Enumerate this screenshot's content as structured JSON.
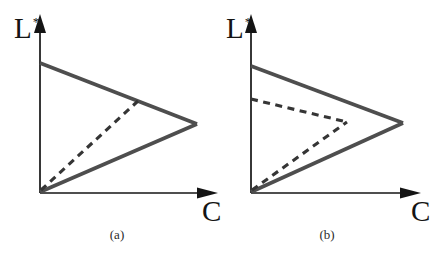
{
  "figure": {
    "background": "#ffffff",
    "colors": {
      "axis": "#141414",
      "solid": "#4e4e4e",
      "dashed": "#353535"
    },
    "panels": [
      {
        "id": "a",
        "caption": "(a)",
        "y_axis_label": "L",
        "y_axis_label_sup": "*",
        "x_axis_label": "C",
        "lines": [
          {
            "name": "y-axis",
            "type": "axis",
            "x1": 40,
            "y1": 193,
            "x2": 40,
            "y2": 26
          },
          {
            "name": "x-axis",
            "type": "axis",
            "x1": 40,
            "y1": 193,
            "x2": 205,
            "y2": 193
          },
          {
            "name": "solid-gamut-upper-edge",
            "type": "solid",
            "x1": 40,
            "y1": 63,
            "x2": 197,
            "y2": 124
          },
          {
            "name": "solid-gamut-lower-edge",
            "type": "solid",
            "x1": 40,
            "y1": 192,
            "x2": 197,
            "y2": 124
          },
          {
            "name": "dashed-gamut-lower-edge",
            "type": "dashed",
            "x1": 41,
            "y1": 190,
            "x2": 138,
            "y2": 101
          }
        ],
        "arrows": [
          {
            "name": "y-axis-arrowhead",
            "points": "40,14 34,33 46,33"
          },
          {
            "name": "x-axis-arrowhead",
            "points": "218,193 197,187.5 197,198.5"
          }
        ]
      },
      {
        "id": "b",
        "caption": "(b)",
        "y_axis_label": "L",
        "y_axis_label_sup": "*",
        "x_axis_label": "C",
        "lines": [
          {
            "name": "y-axis",
            "type": "axis",
            "x1": 251,
            "y1": 193,
            "x2": 251,
            "y2": 26
          },
          {
            "name": "x-axis",
            "type": "axis",
            "x1": 251,
            "y1": 193,
            "x2": 408,
            "y2": 193
          },
          {
            "name": "solid-gamut-upper-edge",
            "type": "solid",
            "x1": 251,
            "y1": 66,
            "x2": 403,
            "y2": 123
          },
          {
            "name": "solid-gamut-lower-edge",
            "type": "solid",
            "x1": 251,
            "y1": 192,
            "x2": 403,
            "y2": 123
          },
          {
            "name": "dashed-gamut-upper-edge",
            "type": "dashed",
            "x1": 251,
            "y1": 99,
            "x2": 347,
            "y2": 122
          },
          {
            "name": "dashed-gamut-lower-edge",
            "type": "dashed",
            "x1": 252,
            "y1": 190,
            "x2": 347,
            "y2": 122
          }
        ],
        "arrows": [
          {
            "name": "y-axis-arrowhead",
            "points": "251,14 245,33 257,33"
          },
          {
            "name": "x-axis-arrowhead",
            "points": "421,193 400,187.5 400,198.5"
          }
        ]
      }
    ]
  }
}
